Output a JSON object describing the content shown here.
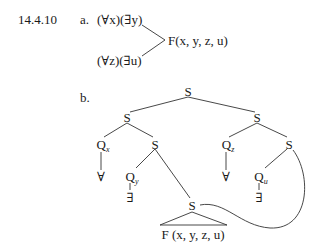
{
  "exercise_number": "14.4.10",
  "part_a": {
    "label": "a.",
    "branch_top": "(∀x)(∃y)",
    "branch_bottom": "(∀z)(∃u)",
    "formula": "F(x, y, z, u)"
  },
  "part_b": {
    "label": "b.",
    "tree": {
      "root": "S",
      "left_s": "S",
      "right_s": "S",
      "q_x": {
        "letter": "Q",
        "sub": "x"
      },
      "left_inner_s": "S",
      "q_z": {
        "letter": "Q",
        "sub": "z"
      },
      "right_inner_s": "S",
      "forall_x": "∀",
      "q_y": {
        "letter": "Q",
        "sub": "y"
      },
      "exists_y": "∃",
      "forall_z": "∀",
      "q_u": {
        "letter": "Q",
        "sub": "u"
      },
      "exists_u": "∃",
      "bottom_s": "S",
      "formula": "F (x, y, z, u)"
    }
  }
}
